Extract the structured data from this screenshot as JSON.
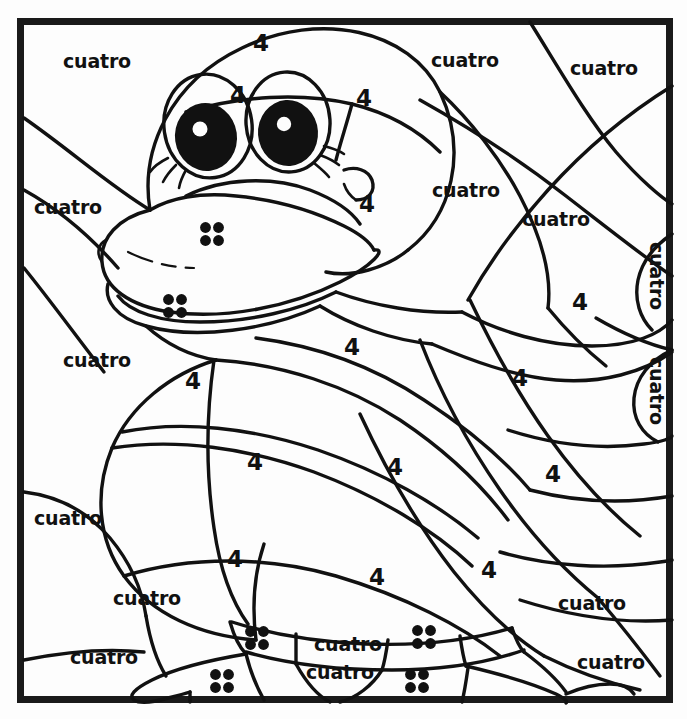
{
  "page": {
    "kind": "color-by-number-worksheet",
    "language": "Spanish",
    "canvas": {
      "width": 687,
      "height": 719
    },
    "background_color": "#fdfdfd",
    "ink_color": "#111111",
    "frame": {
      "x": 17,
      "y": 18,
      "width": 655,
      "height": 684,
      "stroke_width": 7
    }
  },
  "legend": {
    "number_label": "4",
    "word_label": "cuatro",
    "dot_count": 4
  },
  "word_labels": [
    {
      "text": "cuatro",
      "x": 97,
      "y": 62,
      "rotate": 0
    },
    {
      "text": "cuatro",
      "x": 465,
      "y": 61,
      "rotate": 0
    },
    {
      "text": "cuatro",
      "x": 604,
      "y": 69,
      "rotate": 0
    },
    {
      "text": "cuatro",
      "x": 68,
      "y": 208,
      "rotate": 0
    },
    {
      "text": "cuatro",
      "x": 466,
      "y": 191,
      "rotate": 0
    },
    {
      "text": "cuatro",
      "x": 556,
      "y": 220,
      "rotate": 0
    },
    {
      "text": "cuatro",
      "x": 655,
      "y": 276,
      "rotate": 90
    },
    {
      "text": "cuatro",
      "x": 655,
      "y": 391,
      "rotate": 90
    },
    {
      "text": "cuatro",
      "x": 97,
      "y": 361,
      "rotate": 0
    },
    {
      "text": "cuatro",
      "x": 68,
      "y": 519,
      "rotate": 0
    },
    {
      "text": "cuatro",
      "x": 147,
      "y": 599,
      "rotate": 0
    },
    {
      "text": "cuatro",
      "x": 104,
      "y": 658,
      "rotate": 0
    },
    {
      "text": "cuatro",
      "x": 592,
      "y": 604,
      "rotate": 0
    },
    {
      "text": "cuatro",
      "x": 611,
      "y": 663,
      "rotate": 0
    },
    {
      "text": "cuatro",
      "x": 348,
      "y": 645,
      "rotate": 0
    },
    {
      "text": "cuatro",
      "x": 340,
      "y": 673,
      "rotate": 0
    }
  ],
  "number_labels": [
    {
      "text": "4",
      "x": 261,
      "y": 44
    },
    {
      "text": "4",
      "x": 238,
      "y": 96
    },
    {
      "text": "4",
      "x": 364,
      "y": 99
    },
    {
      "text": "4",
      "x": 367,
      "y": 205
    },
    {
      "text": "4",
      "x": 580,
      "y": 303
    },
    {
      "text": "4",
      "x": 352,
      "y": 348
    },
    {
      "text": "4",
      "x": 193,
      "y": 382
    },
    {
      "text": "4",
      "x": 520,
      "y": 379
    },
    {
      "text": "4",
      "x": 255,
      "y": 463
    },
    {
      "text": "4",
      "x": 395,
      "y": 468
    },
    {
      "text": "4",
      "x": 553,
      "y": 475
    },
    {
      "text": "4",
      "x": 235,
      "y": 560
    },
    {
      "text": "4",
      "x": 377,
      "y": 578
    },
    {
      "text": "4",
      "x": 489,
      "y": 571
    }
  ],
  "dot_groups": [
    {
      "cx": 212,
      "cy": 234,
      "r": 5.4,
      "gap": 13
    },
    {
      "cx": 175,
      "cy": 306,
      "r": 5.4,
      "gap": 13
    },
    {
      "cx": 257,
      "cy": 638,
      "r": 5.4,
      "gap": 13
    },
    {
      "cx": 424,
      "cy": 637,
      "r": 5.4,
      "gap": 13
    },
    {
      "cx": 222,
      "cy": 681,
      "r": 5.4,
      "gap": 13
    },
    {
      "cx": 417,
      "cy": 681,
      "r": 5.4,
      "gap": 13
    }
  ]
}
